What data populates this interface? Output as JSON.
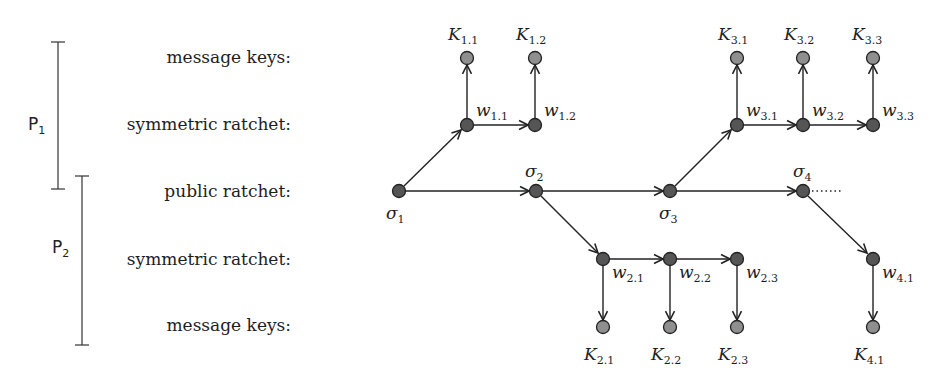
{
  "row_labels": {
    "message_keys_top": "message keys:",
    "symmetric_top": "symmetric ratchet:",
    "public": "public ratchet:",
    "symmetric_bottom": "symmetric ratchet:",
    "message_keys_bottom": "message keys:"
  },
  "parties": [
    {
      "name": "P",
      "sub": "1"
    },
    {
      "name": "P",
      "sub": "2"
    }
  ],
  "colors": {
    "ratchet_node": "#555555",
    "key_node": "#8a8a8a",
    "edge": "#222222"
  },
  "nodes": {
    "sigma": [
      {
        "base": "σ",
        "sub": "1"
      },
      {
        "base": "σ",
        "sub": "2"
      },
      {
        "base": "σ",
        "sub": "3"
      },
      {
        "base": "σ",
        "sub": "4"
      }
    ],
    "w_top": [
      {
        "base": "w",
        "sub": "1.1"
      },
      {
        "base": "w",
        "sub": "1.2"
      },
      {
        "base": "w",
        "sub": "3.1"
      },
      {
        "base": "w",
        "sub": "3.2"
      },
      {
        "base": "w",
        "sub": "3.3"
      }
    ],
    "w_bottom": [
      {
        "base": "w",
        "sub": "2.1"
      },
      {
        "base": "w",
        "sub": "2.2"
      },
      {
        "base": "w",
        "sub": "2.3"
      },
      {
        "base": "w",
        "sub": "4.1"
      }
    ],
    "k_top": [
      {
        "base": "K",
        "sub": "1.1"
      },
      {
        "base": "K",
        "sub": "1.2"
      },
      {
        "base": "K",
        "sub": "3.1"
      },
      {
        "base": "K",
        "sub": "3.2"
      },
      {
        "base": "K",
        "sub": "3.3"
      }
    ],
    "k_bottom": [
      {
        "base": "K",
        "sub": "2.1"
      },
      {
        "base": "K",
        "sub": "2.2"
      },
      {
        "base": "K",
        "sub": "2.3"
      },
      {
        "base": "K",
        "sub": "4.1"
      }
    ]
  },
  "continuation": "...."
}
